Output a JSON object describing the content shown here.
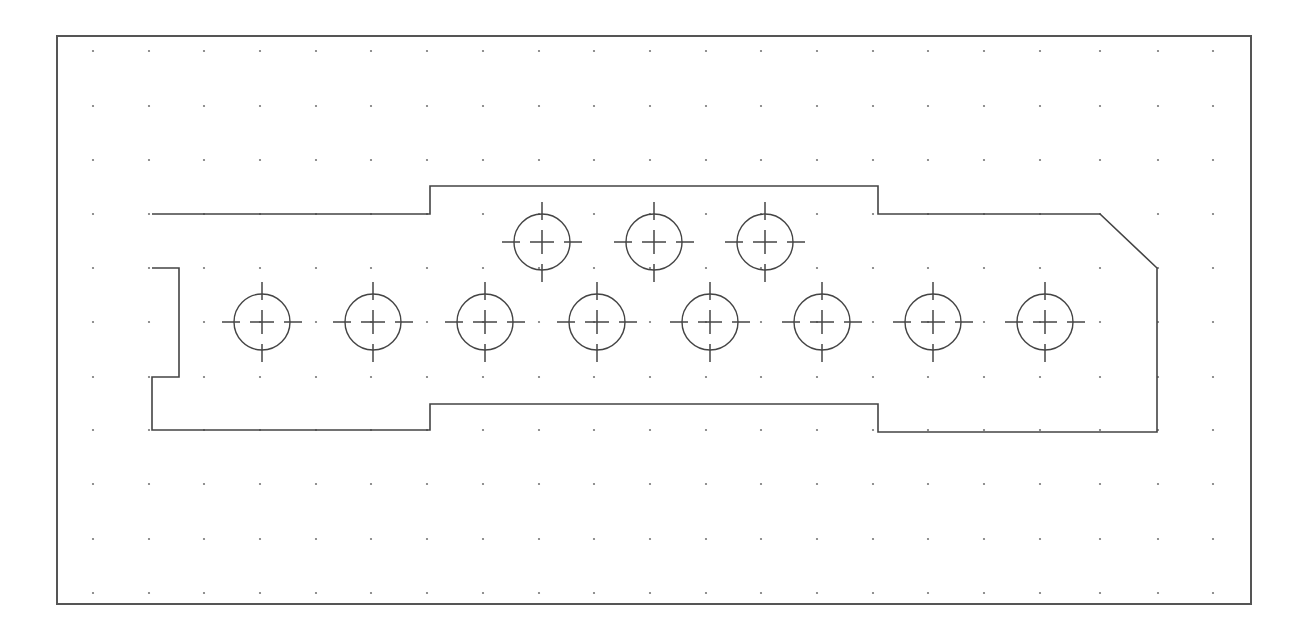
{
  "drawing": {
    "frame": {
      "x": 57,
      "y": 36,
      "width": 1194,
      "height": 568,
      "color": "#555555"
    },
    "grid": {
      "color": "#777777",
      "columns": [
        93,
        149,
        204,
        260,
        316,
        371,
        427,
        483,
        539,
        594,
        650,
        706,
        761,
        817,
        873,
        928,
        984,
        1040,
        1100,
        1158,
        1213
      ],
      "rows": [
        51,
        106,
        160,
        214,
        268,
        322,
        377,
        430,
        484,
        539,
        593
      ]
    },
    "part_outline": {
      "color": "#444444",
      "points": [
        [
          152,
          214
        ],
        [
          430,
          214
        ],
        [
          430,
          186
        ],
        [
          878,
          186
        ],
        [
          878,
          214
        ],
        [
          1100,
          214
        ],
        [
          1157,
          268
        ],
        [
          1157,
          432
        ],
        [
          878,
          432
        ],
        [
          878,
          404
        ],
        [
          430,
          404
        ],
        [
          430,
          430
        ],
        [
          152,
          430
        ],
        [
          152,
          377
        ],
        [
          179,
          377
        ],
        [
          179,
          268
        ],
        [
          152,
          268
        ]
      ]
    },
    "holes": {
      "radius": 28,
      "crosshair_extent": 40,
      "upper_row": [
        {
          "x": 542,
          "y": 242
        },
        {
          "x": 654,
          "y": 242
        },
        {
          "x": 765,
          "y": 242
        }
      ],
      "lower_row": [
        {
          "x": 262,
          "y": 322
        },
        {
          "x": 373,
          "y": 322
        },
        {
          "x": 485,
          "y": 322
        },
        {
          "x": 597,
          "y": 322
        },
        {
          "x": 710,
          "y": 322
        },
        {
          "x": 822,
          "y": 322
        },
        {
          "x": 933,
          "y": 322
        },
        {
          "x": 1045,
          "y": 322
        }
      ]
    }
  }
}
